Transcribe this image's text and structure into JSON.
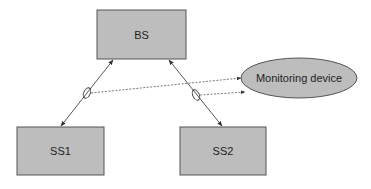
{
  "diagram": {
    "nodes": {
      "bs": {
        "label": "BS",
        "x": 97,
        "y": 10,
        "w": 89,
        "h": 49
      },
      "ss1": {
        "label": "SS1",
        "x": 17,
        "y": 127,
        "w": 87,
        "h": 48
      },
      "ss2": {
        "label": "SS2",
        "x": 180,
        "y": 127,
        "w": 86,
        "h": 48
      },
      "monitor": {
        "label": "Monitoring device",
        "cx": 299,
        "cy": 78,
        "rx": 58,
        "ry": 20
      }
    },
    "edges": [
      {
        "from": "BS",
        "to": "SS1",
        "style": "solid",
        "arrows": "both",
        "tap": "ellipse"
      },
      {
        "from": "BS",
        "to": "SS2",
        "style": "solid",
        "arrows": "both",
        "tap": "ellipse"
      },
      {
        "from": "tap-BS-SS1",
        "to": "Monitoring device",
        "style": "dashed",
        "arrows": "end"
      },
      {
        "from": "tap-BS-SS2",
        "to": "Monitoring device",
        "style": "dashed",
        "arrows": "end"
      }
    ],
    "colors": {
      "box_fill": "#bdbdbd",
      "box_stroke": "#555555",
      "line": "#444444"
    }
  }
}
